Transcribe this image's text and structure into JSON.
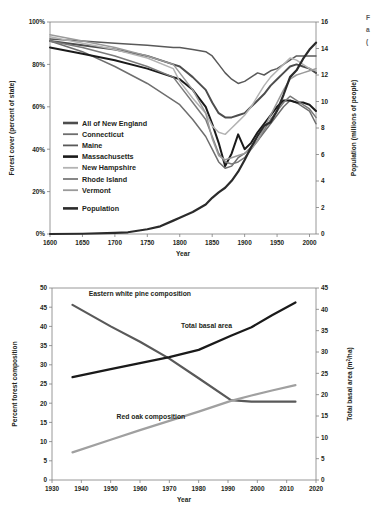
{
  "figure": {
    "edge_fragment_lines": [
      "F",
      "a",
      "("
    ]
  },
  "chart_data": [
    {
      "id": "top",
      "type": "line",
      "title": "",
      "xlabel": "Year",
      "ylabel": "Forest cover (percent of state)",
      "y2label": "Population (millions of people)",
      "xlim": [
        1600,
        2010
      ],
      "xticks": [
        1600,
        1650,
        1700,
        1750,
        1800,
        1850,
        1900,
        1950,
        2000
      ],
      "xticklabels": [
        "1600",
        "1650",
        "1700",
        "1750",
        "1800",
        "1850",
        "1900",
        "1950",
        "2000"
      ],
      "ylim": [
        0,
        100
      ],
      "yticks": [
        0,
        20,
        40,
        60,
        80,
        100
      ],
      "yticklabels": [
        "0%",
        "20%",
        "40%",
        "60%",
        "80%",
        "100%"
      ],
      "y2lim": [
        0,
        16
      ],
      "y2ticks": [
        0,
        2,
        4,
        6,
        8,
        10,
        12,
        14,
        16
      ],
      "y2ticklabels": [
        "0",
        "2",
        "4",
        "6",
        "8",
        "10",
        "12",
        "14",
        "16"
      ],
      "grid": false,
      "legend_position": "inside-left",
      "series": [
        {
          "name": "All of New England",
          "color": "#4d4d4d",
          "width": 2.0,
          "axis": "left",
          "x": [
            1600,
            1650,
            1700,
            1750,
            1790,
            1800,
            1820,
            1840,
            1850,
            1860,
            1870,
            1880,
            1890,
            1900,
            1910,
            1920,
            1930,
            1940,
            1950,
            1960,
            1970,
            1980,
            1990,
            2000,
            2010
          ],
          "y": [
            91,
            89,
            87,
            84,
            80,
            79,
            74,
            68,
            62,
            57,
            55,
            55,
            56,
            57,
            60,
            63,
            66,
            70,
            73,
            76,
            79,
            80,
            79,
            78,
            76
          ]
        },
        {
          "name": "Connecticut",
          "color": "#6e6e6e",
          "width": 1.5,
          "axis": "left",
          "x": [
            1600,
            1650,
            1700,
            1750,
            1790,
            1800,
            1820,
            1840,
            1850,
            1860,
            1870,
            1880,
            1890,
            1900,
            1910,
            1920,
            1930,
            1940,
            1950,
            1960,
            1970,
            1980,
            1990,
            2000,
            2010
          ],
          "y": [
            91,
            86,
            79,
            71,
            63,
            61,
            54,
            46,
            40,
            34,
            31,
            32,
            36,
            38,
            41,
            44,
            48,
            52,
            56,
            60,
            63,
            62,
            60,
            58,
            52
          ]
        },
        {
          "name": "Maine",
          "color": "#595959",
          "width": 1.5,
          "axis": "left",
          "x": [
            1600,
            1650,
            1700,
            1750,
            1790,
            1800,
            1820,
            1840,
            1850,
            1860,
            1870,
            1880,
            1890,
            1900,
            1910,
            1920,
            1930,
            1940,
            1950,
            1960,
            1970,
            1980,
            1990,
            2000,
            2010
          ],
          "y": [
            92,
            91,
            90,
            89,
            88,
            88,
            87,
            86,
            84,
            80,
            76,
            73,
            71,
            72,
            74,
            76,
            75,
            77,
            78,
            80,
            82,
            84,
            84,
            84,
            84
          ]
        },
        {
          "name": "Massachusetts",
          "color": "#1a1a1a",
          "width": 2.0,
          "axis": "left",
          "x": [
            1600,
            1650,
            1700,
            1750,
            1790,
            1800,
            1820,
            1840,
            1850,
            1860,
            1870,
            1880,
            1890,
            1900,
            1910,
            1920,
            1930,
            1940,
            1950,
            1960,
            1970,
            1980,
            1990,
            2000,
            2010
          ],
          "y": [
            88,
            85,
            82,
            78,
            74,
            73,
            68,
            60,
            52,
            43,
            32,
            38,
            47,
            40,
            43,
            48,
            52,
            56,
            60,
            63,
            63,
            62,
            62,
            61,
            58
          ]
        },
        {
          "name": "New Hampshire",
          "color": "#b3b3b3",
          "width": 1.5,
          "axis": "left",
          "x": [
            1600,
            1650,
            1700,
            1750,
            1790,
            1800,
            1820,
            1840,
            1850,
            1860,
            1870,
            1880,
            1890,
            1900,
            1910,
            1920,
            1930,
            1940,
            1950,
            1960,
            1970,
            1980,
            1990,
            2000,
            2010
          ],
          "y": [
            93,
            90,
            87,
            83,
            78,
            72,
            64,
            57,
            51,
            48,
            47,
            50,
            53,
            56,
            60,
            65,
            70,
            74,
            77,
            80,
            83,
            82,
            80,
            78,
            77
          ]
        },
        {
          "name": "Rhode Island",
          "color": "#7a7a7a",
          "width": 1.5,
          "axis": "left",
          "x": [
            1600,
            1650,
            1700,
            1750,
            1790,
            1800,
            1820,
            1840,
            1850,
            1860,
            1870,
            1880,
            1890,
            1900,
            1910,
            1920,
            1930,
            1940,
            1950,
            1960,
            1970,
            1980,
            1990,
            2000,
            2010
          ],
          "y": [
            91,
            88,
            84,
            79,
            74,
            70,
            62,
            54,
            46,
            38,
            34,
            33,
            34,
            36,
            40,
            44,
            49,
            54,
            58,
            62,
            65,
            63,
            61,
            59,
            55
          ]
        },
        {
          "name": "Vermont",
          "color": "#9a9a9a",
          "width": 1.5,
          "axis": "left",
          "x": [
            1600,
            1650,
            1700,
            1750,
            1790,
            1800,
            1820,
            1840,
            1850,
            1860,
            1870,
            1880,
            1890,
            1900,
            1910,
            1920,
            1930,
            1940,
            1950,
            1960,
            1970,
            1980,
            1990,
            2000,
            2010
          ],
          "y": [
            94,
            91,
            88,
            84,
            80,
            76,
            68,
            57,
            45,
            37,
            35,
            36,
            37,
            38,
            40,
            44,
            50,
            56,
            62,
            68,
            73,
            75,
            76,
            77,
            78
          ]
        },
        {
          "name": "Population",
          "color": "#2b2b2b",
          "width": 2.2,
          "axis": "right",
          "x": [
            1600,
            1650,
            1700,
            1720,
            1750,
            1770,
            1790,
            1800,
            1820,
            1840,
            1850,
            1860,
            1870,
            1880,
            1890,
            1900,
            1910,
            1920,
            1930,
            1940,
            1950,
            1960,
            1970,
            1980,
            1990,
            2000,
            2010
          ],
          "y": [
            0.0,
            0.02,
            0.09,
            0.13,
            0.36,
            0.58,
            1.01,
            1.23,
            1.66,
            2.23,
            2.73,
            3.14,
            3.49,
            4.01,
            4.7,
            5.59,
            6.55,
            7.4,
            8.17,
            8.44,
            9.31,
            10.51,
            11.84,
            12.35,
            13.21,
            13.92,
            14.44
          ]
        }
      ],
      "legend": [
        {
          "label": "All of New England",
          "color": "#4d4d4d",
          "width": 2.6
        },
        {
          "label": "Connecticut",
          "color": "#6e6e6e",
          "width": 1.8
        },
        {
          "label": "Maine",
          "color": "#595959",
          "width": 1.8
        },
        {
          "label": "Massachusetts",
          "color": "#1a1a1a",
          "width": 2.6
        },
        {
          "label": "New Hampshire",
          "color": "#b3b3b3",
          "width": 1.8
        },
        {
          "label": "Rhode Island",
          "color": "#7a7a7a",
          "width": 1.8
        },
        {
          "label": "Vermont",
          "color": "#9a9a9a",
          "width": 1.8
        },
        {
          "label": "Population",
          "color": "#2b2b2b",
          "width": 2.6
        }
      ]
    },
    {
      "id": "bottom",
      "type": "line",
      "title": "",
      "xlabel": "Year",
      "ylabel": "Percent forest composition",
      "y2label": "Total basal area (m²/ha)",
      "xlim": [
        1930,
        2020
      ],
      "xticks": [
        1930,
        1940,
        1950,
        1960,
        1970,
        1980,
        1990,
        2000,
        2010,
        2020
      ],
      "xticklabels": [
        "1930",
        "1940",
        "1950",
        "1960",
        "1970",
        "1980",
        "1990",
        "2000",
        "2010",
        "2020"
      ],
      "ylim": [
        0,
        50
      ],
      "yticks": [
        0,
        5,
        10,
        15,
        20,
        25,
        30,
        35,
        40,
        45,
        50
      ],
      "yticklabels": [
        "0",
        "5",
        "10",
        "15",
        "20",
        "25",
        "30",
        "35",
        "40",
        "45",
        "50"
      ],
      "y2lim": [
        0,
        45
      ],
      "y2ticks": [
        0,
        5,
        10,
        15,
        20,
        25,
        30,
        35,
        40,
        45
      ],
      "y2ticklabels": [
        "0",
        "5",
        "10",
        "15",
        "20",
        "25",
        "30",
        "35",
        "40",
        "45"
      ],
      "grid": false,
      "legend_position": "annotations",
      "series": [
        {
          "name": "Eastern white pine composition",
          "color": "#595959",
          "width": 2.2,
          "axis": "left",
          "x": [
            1937,
            1950,
            1960,
            1970,
            1980,
            1991,
            1998,
            2005,
            2013
          ],
          "y": [
            45.6,
            40.0,
            36.0,
            31.6,
            26.5,
            20.8,
            20.4,
            20.4,
            20.4
          ]
        },
        {
          "name": "Total basal area",
          "color": "#1a1a1a",
          "width": 2.2,
          "axis": "right",
          "x": [
            1937,
            1950,
            1960,
            1970,
            1980,
            1991,
            1998,
            2005,
            2013
          ],
          "y": [
            24.1,
            26.0,
            27.4,
            28.8,
            30.5,
            33.8,
            35.8,
            38.6,
            41.6
          ]
        },
        {
          "name": "Red oak composition",
          "color": "#a0a0a0",
          "width": 2.2,
          "axis": "left",
          "x": [
            1937,
            1950,
            1960,
            1970,
            1980,
            1991,
            1998,
            2005,
            2013
          ],
          "y": [
            7.2,
            10.5,
            13.0,
            15.4,
            17.8,
            20.6,
            22.0,
            23.3,
            24.7
          ]
        }
      ],
      "annotations": [
        {
          "text": "Eastern white pine composition",
          "x": 1942.5,
          "y": 48.0,
          "anchor": "start"
        },
        {
          "text": "Total basal area",
          "x": 1974.0,
          "y": 39.5,
          "anchor": "start"
        },
        {
          "text": "Red oak composition",
          "x": 1952.0,
          "y": 15.8,
          "anchor": "start"
        }
      ]
    }
  ]
}
